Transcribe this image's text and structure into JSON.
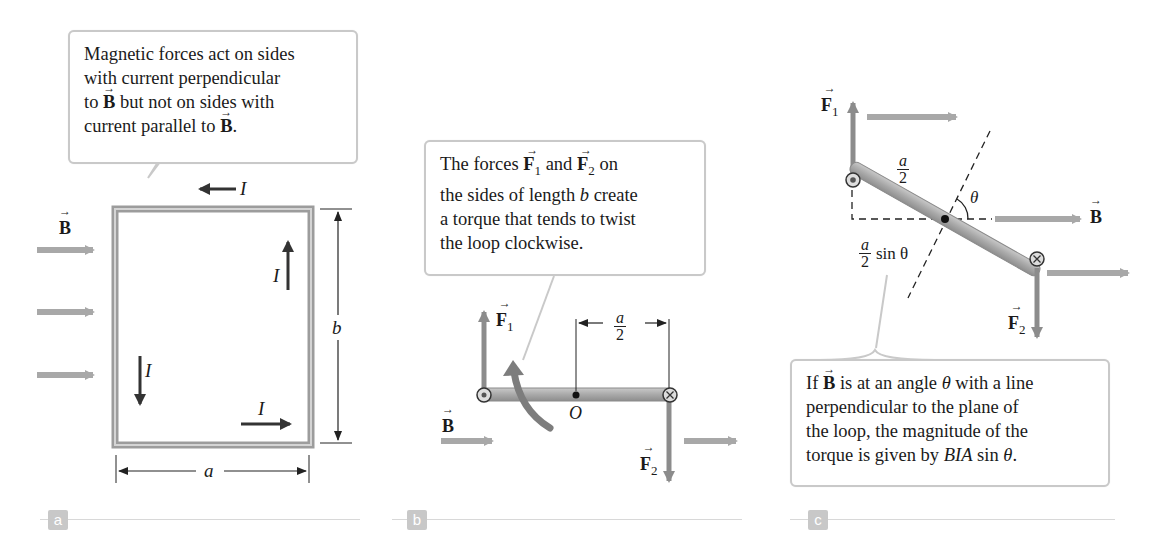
{
  "panels": {
    "a": {
      "tag": "a",
      "callout": {
        "line1": "Magnetic forces act on sides",
        "line2": "with current perpendicular",
        "line3_pre": "to ",
        "line3_vec": "B",
        "line3_post": " but not on sides with",
        "line4_pre": "current parallel to ",
        "line4_vec": "B",
        "line4_post": "."
      },
      "labels": {
        "field": "B",
        "current": "I",
        "width": "a",
        "height": "b"
      }
    },
    "b": {
      "tag": "b",
      "callout": {
        "line1_pre": "The forces ",
        "line1_vec1": "F",
        "line1_sub1": "1",
        "line1_mid": " and ",
        "line1_vec2": "F",
        "line1_sub2": "2",
        "line1_post": " on",
        "line2_pre": "the sides of length ",
        "line2_var": "b",
        "line2_post": " create",
        "line3": "a torque that tends to twist",
        "line4": "the loop clockwise."
      },
      "labels": {
        "force1": "F",
        "force1_sub": "1",
        "force2": "F",
        "force2_sub": "2",
        "field": "B",
        "origin": "O",
        "half_num": "a",
        "half_den": "2"
      }
    },
    "c": {
      "tag": "c",
      "callout": {
        "line1_pre": "If ",
        "line1_vec": "B",
        "line1_mid": " is at an angle ",
        "line1_var": "θ",
        "line1_post": " with a line",
        "line2": "perpendicular to the plane of",
        "line3": "the loop, the magnitude of the",
        "line4_pre": "torque is given by ",
        "line4_var": "BIA",
        "line4_mid": " sin ",
        "line4_var2": "θ",
        "line4_post": "."
      },
      "labels": {
        "force1": "F",
        "force1_sub": "1",
        "force2": "F",
        "force2_sub": "2",
        "field": "B",
        "angle": "θ",
        "half_num": "a",
        "half_den": "2",
        "moment_arm_num": "a",
        "moment_arm_den": "2",
        "moment_arm_suffix": "sin θ"
      }
    }
  },
  "colors": {
    "field_arrow": "#a8a8a8",
    "force_arrow": "#8c8c8c",
    "loop_wire": "#9a9a9a",
    "current_arrow": "#333333",
    "callout_border": "#c9c9c9",
    "panel_tag": "#c8c8c8"
  }
}
